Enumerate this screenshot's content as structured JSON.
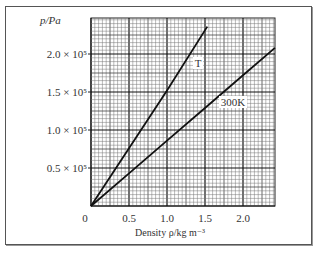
{
  "chart_data": {
    "type": "line",
    "title": "",
    "xlabel": "Density ρ/kg m⁻³",
    "ylabel": "p/Pa",
    "xlim": [
      0,
      2.42
    ],
    "ylim": [
      0,
      240000
    ],
    "grid": true,
    "x_ticks": [
      {
        "value": 0,
        "label": "0"
      },
      {
        "value": 0.5,
        "label": "0.5"
      },
      {
        "value": 1.0,
        "label": "1.0"
      },
      {
        "value": 1.5,
        "label": "1.5"
      },
      {
        "value": 2.0,
        "label": "2.0"
      }
    ],
    "y_ticks": [
      {
        "value": 50000,
        "label": "0.5 × 10⁵"
      },
      {
        "value": 100000,
        "label": "1.0 × 10⁵"
      },
      {
        "value": 150000,
        "label": "1.5 × 10⁵"
      },
      {
        "value": 200000,
        "label": "2.0 × 10⁵"
      }
    ],
    "series": [
      {
        "name": "T",
        "x": [
          0,
          0.5,
          1.0,
          1.53
        ],
        "y": [
          0,
          76000,
          152000,
          236000
        ]
      },
      {
        "name": "300K",
        "x": [
          0,
          0.5,
          1.0,
          1.5,
          2.0,
          2.42
        ],
        "y": [
          0,
          43000,
          86000,
          129000,
          172000,
          208000
        ]
      }
    ],
    "annotations": [
      {
        "text": "T",
        "series": "T"
      },
      {
        "text": "300K",
        "series": "300K"
      }
    ]
  }
}
